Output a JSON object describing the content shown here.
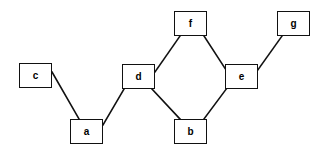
{
  "diagram": {
    "background_color": "#ffffff",
    "node_fill_color": "#ffffff",
    "node_border_color": "#111111",
    "edge_color": "#111111",
    "nodes": [
      {
        "id": "c",
        "label": "c",
        "x": 19,
        "y": 63,
        "w": 33,
        "h": 25
      },
      {
        "id": "a",
        "label": "a",
        "x": 70,
        "y": 119,
        "w": 33,
        "h": 25
      },
      {
        "id": "d",
        "label": "d",
        "x": 122,
        "y": 64,
        "w": 33,
        "h": 25
      },
      {
        "id": "f",
        "label": "f",
        "x": 174,
        "y": 11,
        "w": 33,
        "h": 25
      },
      {
        "id": "b",
        "label": "b",
        "x": 174,
        "y": 119,
        "w": 33,
        "h": 25
      },
      {
        "id": "e",
        "label": "e",
        "x": 225,
        "y": 64,
        "w": 33,
        "h": 25
      },
      {
        "id": "g",
        "label": "g",
        "x": 277,
        "y": 11,
        "w": 33,
        "h": 25
      }
    ],
    "edges": [
      {
        "from": "c",
        "to": "a",
        "x1": 52,
        "y1": 72,
        "x2": 79,
        "y2": 119
      },
      {
        "from": "a",
        "to": "d",
        "x1": 103,
        "y1": 125,
        "x2": 124,
        "y2": 89
      },
      {
        "from": "d",
        "to": "f",
        "x1": 155,
        "y1": 72,
        "x2": 180,
        "y2": 36
      },
      {
        "from": "d",
        "to": "b",
        "x1": 152,
        "y1": 89,
        "x2": 180,
        "y2": 119
      },
      {
        "from": "f",
        "to": "e",
        "x1": 204,
        "y1": 36,
        "x2": 228,
        "y2": 73
      },
      {
        "from": "b",
        "to": "e",
        "x1": 204,
        "y1": 119,
        "x2": 227,
        "y2": 88
      },
      {
        "from": "e",
        "to": "g",
        "x1": 255,
        "y1": 74,
        "x2": 282,
        "y2": 36
      }
    ]
  }
}
